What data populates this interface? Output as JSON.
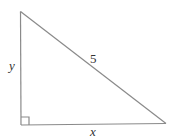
{
  "diagram": {
    "type": "right-triangle",
    "labels": {
      "vertical_leg": "y",
      "hypotenuse": "5",
      "horizontal_leg": "x"
    },
    "right_angle_marker": true,
    "colors": {
      "stroke": "#8a8a8a",
      "text": "#333333",
      "background": "#ffffff"
    }
  }
}
